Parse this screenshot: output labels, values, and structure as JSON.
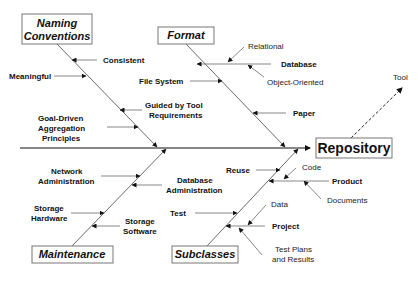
{
  "effect": {
    "label": "Repository"
  },
  "tool": {
    "label": "Tool"
  },
  "categories": {
    "naming": {
      "line1": "Naming",
      "line2": "Conventions"
    },
    "format": {
      "label": "Format"
    },
    "maintenance": {
      "label": "Maintenance"
    },
    "subclasses": {
      "label": "Subclasses"
    }
  },
  "causes": {
    "consistent": "Consistent",
    "meaningful": "Meaningful",
    "guided1": "Guided by Tool",
    "guided2": "Requirements",
    "goal1": "Goal-Driven",
    "goal2": "Aggregation",
    "goal3": "Principles",
    "relational": "Relational",
    "database": "Database",
    "object_oriented": "Object-Oriented",
    "file_system": "File System",
    "paper": "Paper",
    "network1": "Network",
    "network2": "Administration",
    "dbadmin1": "Database",
    "dbadmin2": "Administration",
    "storage_hw1": "Storage",
    "storage_hw2": "Hardware",
    "storage_sw1": "Storage",
    "storage_sw2": "Software",
    "reuse": "Reuse",
    "code": "Code",
    "product": "Product",
    "documents": "Documents",
    "test": "Test",
    "data": "Data",
    "project": "Project",
    "testplans1": "Test Plans",
    "testplans2": "and Results"
  }
}
